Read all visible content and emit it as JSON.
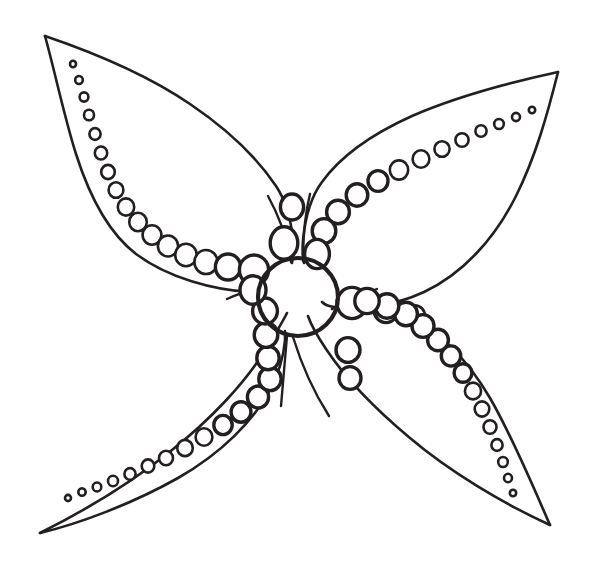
{
  "artwork": {
    "title": "Four-Petal Flower Line Drawing",
    "alt_text": "Black outline coloring-page drawing of a four-petaled flower with a round center and rows of graduated circles along each petal",
    "style": "coloring-page-line-art",
    "background_color": "#ffffff",
    "stroke_color": "#231f20",
    "canvas": {
      "width": 604,
      "height": 567
    },
    "center": {
      "name": "flower-center",
      "cx": 298,
      "cy": 297,
      "rx": 40,
      "ry": 39,
      "stroke_width": 4.2
    },
    "petals": [
      {
        "id": "petal-top-left",
        "label": "Top Left Petal",
        "tip": {
          "x": 45,
          "y": 36
        },
        "outer_path": "M45,36 C120,60 190,96 240,160 C268,196 286,236 292,262",
        "inner_path": "M45,36 C62,96 86,170 128,224 C166,272 228,292 262,290",
        "bead_count": 18,
        "bead_start": {
          "x": 74,
          "y": 65,
          "r": 3.0
        },
        "bead_end": {
          "x": 247,
          "y": 266,
          "r": 15.5
        }
      },
      {
        "id": "petal-top-right",
        "label": "Top Right Petal",
        "tip": {
          "x": 558,
          "y": 72
        },
        "outer_path": "M558,72 C470,92 392,126 346,176 C318,208 306,240 304,262",
        "inner_path": "M558,72 C546,130 512,198 460,244 C410,288 352,300 322,300",
        "bead_count": 16,
        "bead_start": {
          "x": 531,
          "y": 110,
          "r": 3.2
        },
        "bead_end": {
          "x": 331,
          "y": 243,
          "r": 16.0
        }
      },
      {
        "id": "petal-bottom-left",
        "label": "Bottom Left Petal",
        "tip": {
          "x": 40,
          "y": 533
        },
        "outer_path": "M40,533 C112,500 182,452 230,396 C262,358 282,326 288,312",
        "inner_path": "M40,533 C92,516 166,486 212,450 C256,414 278,372 284,336",
        "bead_count": 17,
        "bead_start": {
          "x": 69,
          "y": 498,
          "r": 3.0
        },
        "bead_end": {
          "x": 266,
          "y": 352,
          "r": 14.5
        }
      },
      {
        "id": "petal-bottom-right",
        "label": "Bottom Right Petal",
        "tip": {
          "x": 550,
          "y": 525
        },
        "outer_path": "M550,525 C470,494 398,448 356,400 C326,364 312,332 308,316",
        "inner_path": "M550,525 C524,466 498,404 452,362 C404,320 362,308 336,310",
        "bead_count": 16,
        "bead_start": {
          "x": 514,
          "y": 492,
          "r": 3.2
        },
        "bead_end": {
          "x": 345,
          "y": 319,
          "r": 16.5
        }
      }
    ],
    "stubs": [
      {
        "id": "stub-top-left",
        "path": "M292,262 C288,240 278,214 266,194"
      },
      {
        "id": "stub-top-right",
        "path": "M304,261 C304,238 306,214 310,194"
      },
      {
        "id": "stub-bottom-left",
        "path": "M288,336 C286,356 284,382 282,404"
      },
      {
        "id": "stub-bottom-right",
        "path": "M292,337 C300,362 312,390 328,414"
      },
      {
        "id": "stub-left-center",
        "path": "M260,288 C250,290 238,294 228,298"
      },
      {
        "id": "stub-right-center",
        "path": "M336,300 C348,298 362,294 374,290"
      }
    ]
  }
}
